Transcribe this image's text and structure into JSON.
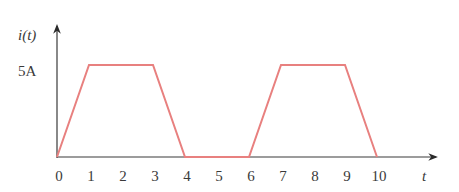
{
  "chart_data": {
    "type": "line",
    "title": "",
    "xlabel": "t",
    "ylabel": "i(t)",
    "xlim": [
      0,
      10
    ],
    "ylim": [
      0,
      5
    ],
    "grid": false,
    "x_ticks": [
      0,
      1,
      2,
      3,
      4,
      5,
      6,
      7,
      8,
      9,
      10
    ],
    "x_tick_labels": [
      "0",
      "1",
      "2",
      "3",
      "4",
      "5",
      "6",
      "7",
      "8",
      "9",
      "10"
    ],
    "y_ticks": [
      5
    ],
    "y_tick_labels": [
      "5A"
    ],
    "series": [
      {
        "name": "i(t)",
        "color": "#e8807f",
        "x": [
          0,
          1,
          3,
          4,
          6,
          7,
          9,
          10
        ],
        "y": [
          0,
          5,
          5,
          0,
          0,
          5,
          5,
          0
        ]
      }
    ]
  }
}
